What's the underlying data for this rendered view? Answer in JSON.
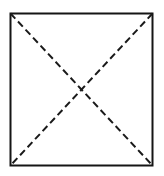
{
  "figure": {
    "name": "square-with-dashed-diagonals",
    "background_color": "#ffffff",
    "canvas": {
      "width": 164,
      "height": 176
    },
    "square": {
      "name": "square-outline",
      "left": 10.5,
      "top": 13.5,
      "right": 152.5,
      "bottom": 165.5,
      "stroke_color": "#151515",
      "stroke_width": 2,
      "fill": "none",
      "corners": {
        "top_left": "10.5,13.5",
        "top_right": "152.5,13.5",
        "bottom_right": "152.5,165.5",
        "bottom_left": "10.5,165.5"
      }
    },
    "diagonals": [
      {
        "name": "diagonal-top-left-to-bottom-right",
        "x1": 10.5,
        "y1": 13.5,
        "x2": 152.5,
        "y2": 165.5,
        "stroke_color": "#1a1a1a",
        "stroke_width": 2,
        "dash_length": 7,
        "gap_length": 4
      },
      {
        "name": "diagonal-top-right-to-bottom-left",
        "x1": 152.5,
        "y1": 13.5,
        "x2": 10.5,
        "y2": 165.5,
        "stroke_color": "#1a1a1a",
        "stroke_width": 2,
        "dash_length": 7,
        "gap_length": 4
      }
    ],
    "intersection": {
      "name": "diagonal-intersection-point",
      "x": 81.5,
      "y": 89.5,
      "label": ""
    },
    "labels": []
  }
}
